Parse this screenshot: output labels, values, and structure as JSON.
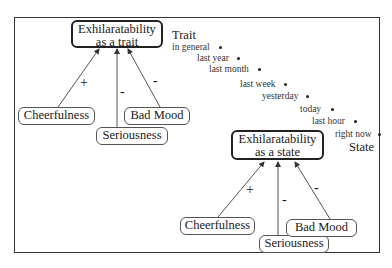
{
  "diagram": {
    "trait_model": {
      "title_line1": "Exhilaratability",
      "title_line2": "as a trait",
      "children": [
        {
          "label": "Cheerfulness",
          "sign": "+"
        },
        {
          "label": "Seriousness",
          "sign": "-"
        },
        {
          "label": "Bad Mood",
          "sign": "-"
        }
      ]
    },
    "state_model": {
      "title_line1": "Exhilaratability",
      "title_line2": "as a state",
      "children": [
        {
          "label": "Cheerfulness",
          "sign": "+"
        },
        {
          "label": "Seriousness",
          "sign": "-"
        },
        {
          "label": "Bad Mood",
          "sign": "-"
        }
      ]
    },
    "time_scale": {
      "start_label": "Trait",
      "end_label": "State",
      "items": [
        "in general",
        "last year",
        "last month",
        "last week",
        "yesterday",
        "today",
        "last hour",
        "right now"
      ]
    },
    "colors": {
      "line": "#333333",
      "text": "#1a1a1a",
      "background": "#ffffff"
    }
  }
}
